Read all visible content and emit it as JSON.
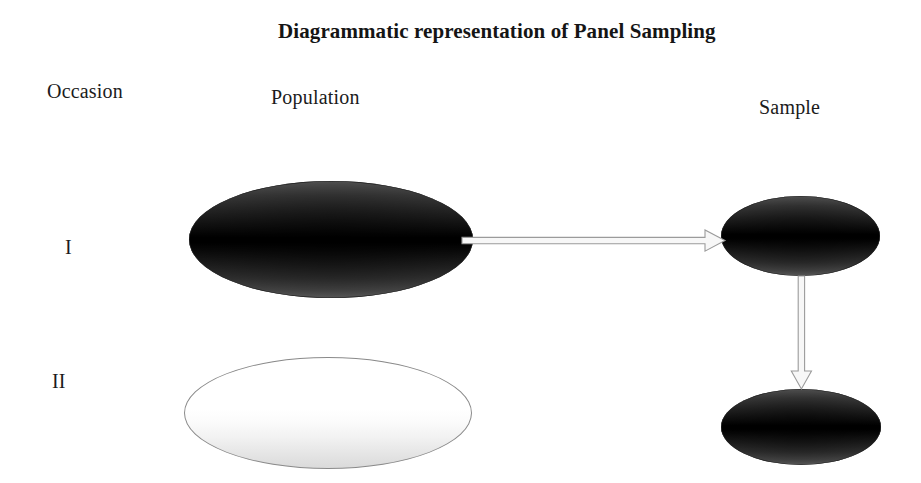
{
  "diagram": {
    "title": "Diagrammatic representation of Panel Sampling",
    "background_color": "#ffffff",
    "text_color": "#1b1b1b",
    "columns": [
      {
        "id": "occasion",
        "label": "Occasion"
      },
      {
        "id": "population",
        "label": "Population"
      },
      {
        "id": "sample",
        "label": "Sample"
      }
    ],
    "rows": [
      {
        "id": "occasion-1",
        "label": "I"
      },
      {
        "id": "occasion-2",
        "label": "II"
      }
    ],
    "shapes": [
      {
        "id": "population-occasion-1",
        "name": "population-ellipse-occasion-1",
        "type": "ellipse",
        "column": "Population",
        "row": "I",
        "fill": "dark-gradient",
        "fill_color": "#000000",
        "outline_color": "#2b2b2b"
      },
      {
        "id": "population-occasion-2",
        "name": "population-ellipse-occasion-2",
        "type": "ellipse",
        "column": "Population",
        "row": "II",
        "fill": "light-gradient",
        "fill_color": "#ffffff",
        "outline_color": "#8a8a8a"
      },
      {
        "id": "sample-occasion-1",
        "name": "sample-ellipse-occasion-1",
        "type": "ellipse",
        "column": "Sample",
        "row": "I",
        "fill": "dark-gradient",
        "fill_color": "#000000",
        "outline_color": "#2b2b2b"
      },
      {
        "id": "sample-occasion-2",
        "name": "sample-ellipse-occasion-2",
        "type": "ellipse",
        "column": "Sample",
        "row": "II",
        "fill": "dark-gradient",
        "fill_color": "#000000",
        "outline_color": "#2b2b2b"
      }
    ],
    "connectors": [
      {
        "id": "arrow-population-to-sample",
        "name": "arrow-population-to-sample",
        "type": "block-arrow",
        "direction": "right",
        "from": "population-occasion-1",
        "to": "sample-occasion-1",
        "stroke_color": "#9b9b9b",
        "fill_color": "#f7f7f7"
      },
      {
        "id": "arrow-sample-to-sample",
        "name": "arrow-sample-to-sample",
        "type": "block-arrow",
        "direction": "down",
        "from": "sample-occasion-1",
        "to": "sample-occasion-2",
        "stroke_color": "#9b9b9b",
        "fill_color": "#f7f7f7"
      }
    ]
  }
}
